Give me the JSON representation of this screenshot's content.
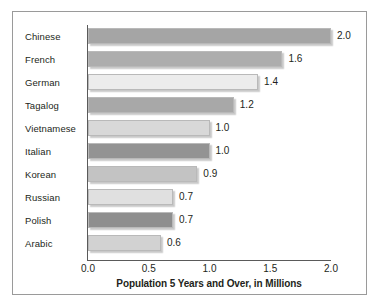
{
  "chart_data": {
    "type": "bar",
    "orientation": "horizontal",
    "title": "",
    "xlabel": "Population 5 Years and Over, in Millions",
    "ylabel": "",
    "xlim": [
      0.0,
      2.0
    ],
    "xticks": [
      "0.0",
      "0.5",
      "1.0",
      "1.5",
      "2.0"
    ],
    "xtick_values": [
      0.0,
      0.5,
      1.0,
      1.5,
      2.0
    ],
    "grid": false,
    "legend": "none",
    "categories": [
      "Chinese",
      "French",
      "German",
      "Tagalog",
      "Vietnamese",
      "Italian",
      "Korean",
      "Russian",
      "Polish",
      "Arabic"
    ],
    "values": [
      2.0,
      1.6,
      1.4,
      1.2,
      1.0,
      1.0,
      0.9,
      0.7,
      0.7,
      0.6
    ],
    "value_labels": [
      "2.0",
      "1.6",
      "1.4",
      "1.2",
      "1.0",
      "1.0",
      "0.9",
      "0.7",
      "0.7",
      "0.6"
    ],
    "bar_colors": [
      "#a5a5a5",
      "#adadad",
      "#ececec",
      "#a8a8a8",
      "#d8d8d8",
      "#939393",
      "#c3c3c3",
      "#e0e0e0",
      "#8e8e8e",
      "#d2d2d2"
    ],
    "frame_color": "#9a9a9a",
    "axis_color": "#5a5a5a",
    "text_color": "#231f20",
    "background": "#ffffff"
  }
}
